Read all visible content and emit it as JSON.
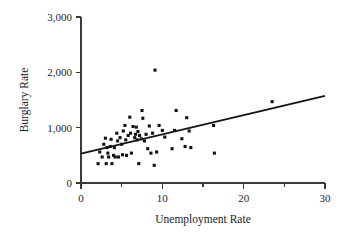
{
  "chart_data": {
    "type": "scatter",
    "title": "",
    "xlabel": "Unemployment Rate",
    "ylabel": "Burglary Rate",
    "xlim": [
      0,
      30
    ],
    "ylim": [
      0,
      3000
    ],
    "xticks": [
      0,
      10,
      20,
      30
    ],
    "xtick_labels": [
      "0",
      "10",
      "20",
      "30"
    ],
    "xticks_minor": [
      5,
      15,
      25
    ],
    "yticks": [
      0,
      1000,
      2000,
      3000
    ],
    "ytick_labels": [
      "0",
      "1,000",
      "2,000",
      "3,000"
    ],
    "grid": false,
    "legend": null,
    "point_color": "#141414",
    "line_color": "#151515",
    "axis_color": "#3a3a3a",
    "marker": "square",
    "trendline": {
      "type": "linear",
      "x_start": 0,
      "y_start": 530,
      "x_end": 30,
      "y_end": 1575
    },
    "points": [
      {
        "x": 2.1,
        "y": 350
      },
      {
        "x": 2.3,
        "y": 560
      },
      {
        "x": 2.6,
        "y": 470
      },
      {
        "x": 2.8,
        "y": 700
      },
      {
        "x": 3.0,
        "y": 810
      },
      {
        "x": 3.1,
        "y": 350
      },
      {
        "x": 3.2,
        "y": 640
      },
      {
        "x": 3.3,
        "y": 540
      },
      {
        "x": 3.4,
        "y": 470
      },
      {
        "x": 3.6,
        "y": 660
      },
      {
        "x": 3.7,
        "y": 790
      },
      {
        "x": 3.8,
        "y": 350
      },
      {
        "x": 4.0,
        "y": 500
      },
      {
        "x": 4.1,
        "y": 640
      },
      {
        "x": 4.2,
        "y": 470
      },
      {
        "x": 4.4,
        "y": 900
      },
      {
        "x": 4.5,
        "y": 760
      },
      {
        "x": 4.6,
        "y": 470
      },
      {
        "x": 4.8,
        "y": 820
      },
      {
        "x": 5.0,
        "y": 700
      },
      {
        "x": 5.1,
        "y": 510
      },
      {
        "x": 5.2,
        "y": 940
      },
      {
        "x": 5.4,
        "y": 1040
      },
      {
        "x": 5.5,
        "y": 780
      },
      {
        "x": 5.6,
        "y": 500
      },
      {
        "x": 5.8,
        "y": 860
      },
      {
        "x": 6.0,
        "y": 1190
      },
      {
        "x": 6.1,
        "y": 900
      },
      {
        "x": 6.2,
        "y": 540
      },
      {
        "x": 6.4,
        "y": 1020
      },
      {
        "x": 6.6,
        "y": 820
      },
      {
        "x": 6.7,
        "y": 880
      },
      {
        "x": 6.8,
        "y": 1010
      },
      {
        "x": 6.9,
        "y": 780
      },
      {
        "x": 7.0,
        "y": 930
      },
      {
        "x": 7.1,
        "y": 350
      },
      {
        "x": 7.2,
        "y": 860
      },
      {
        "x": 7.4,
        "y": 800
      },
      {
        "x": 7.5,
        "y": 1310
      },
      {
        "x": 7.6,
        "y": 1170
      },
      {
        "x": 7.8,
        "y": 760
      },
      {
        "x": 8.0,
        "y": 880
      },
      {
        "x": 8.2,
        "y": 620
      },
      {
        "x": 8.4,
        "y": 1030
      },
      {
        "x": 8.6,
        "y": 540
      },
      {
        "x": 8.8,
        "y": 900
      },
      {
        "x": 9.0,
        "y": 320
      },
      {
        "x": 9.1,
        "y": 2040
      },
      {
        "x": 9.3,
        "y": 560
      },
      {
        "x": 9.6,
        "y": 1040
      },
      {
        "x": 10.0,
        "y": 950
      },
      {
        "x": 10.3,
        "y": 830
      },
      {
        "x": 11.2,
        "y": 620
      },
      {
        "x": 11.5,
        "y": 950
      },
      {
        "x": 11.7,
        "y": 1310
      },
      {
        "x": 12.4,
        "y": 800
      },
      {
        "x": 12.8,
        "y": 660
      },
      {
        "x": 13.0,
        "y": 1180
      },
      {
        "x": 13.3,
        "y": 940
      },
      {
        "x": 13.5,
        "y": 640
      },
      {
        "x": 16.3,
        "y": 1040
      },
      {
        "x": 16.4,
        "y": 540
      },
      {
        "x": 23.5,
        "y": 1470
      }
    ]
  }
}
